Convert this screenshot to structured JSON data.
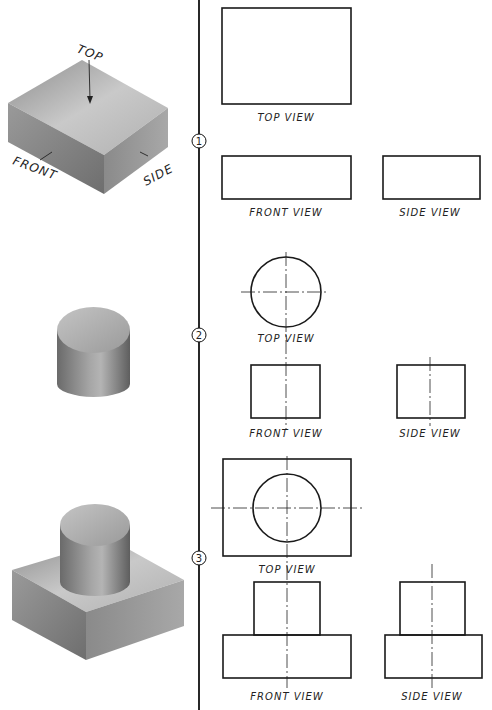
{
  "pictorial_labels": {
    "top": "TOP",
    "front": "FRONT",
    "side": "SIDE"
  },
  "examples": [
    {
      "number": "1",
      "object": "rectangular block",
      "views": {
        "top": "TOP VIEW",
        "front": "FRONT VIEW",
        "side": "SIDE VIEW"
      }
    },
    {
      "number": "2",
      "object": "cylinder",
      "views": {
        "top": "TOP VIEW",
        "front": "FRONT VIEW",
        "side": "SIDE VIEW"
      }
    },
    {
      "number": "3",
      "object": "cylinder on rectangular block",
      "views": {
        "top": "TOP VIEW",
        "front": "FRONT VIEW",
        "side": "SIDE VIEW"
      }
    }
  ],
  "colors": {
    "line": "#1a1a1a",
    "background": "#ffffff",
    "shade_light": "#cfcfcf",
    "shade_dark": "#7a7a7a"
  }
}
